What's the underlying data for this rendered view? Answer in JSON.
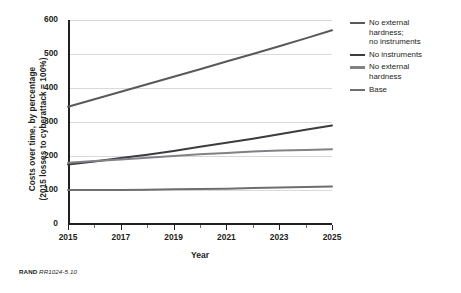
{
  "figure": {
    "caption_prefix": "RAND",
    "caption_code": "RR1024-5.10"
  },
  "axes": {
    "ylabel_line1": "Costs over time, by percentage",
    "ylabel_line2": "(2015 losses to cyberattack = 100%)",
    "xlabel": "Year",
    "ytick_labels": [
      "600",
      "500",
      "400",
      "300",
      "200",
      "100",
      "0"
    ],
    "xtick_labels": [
      "2015",
      "2017",
      "2019",
      "2021",
      "2023",
      "2025"
    ],
    "xtick_minor_values": [
      2016,
      2018,
      2020,
      2022,
      2024
    ]
  },
  "legend": {
    "position": "right",
    "items": [
      {
        "label_line1": "No external",
        "label_line2": "hardness;",
        "label_line3": "no instruments",
        "color": "#58595b"
      },
      {
        "label_line1": "No instruments",
        "label_line2": "",
        "label_line3": "",
        "color": "#3c3c3e"
      },
      {
        "label_line1": "No external",
        "label_line2": "hardness",
        "label_line3": "",
        "color": "#808285"
      },
      {
        "label_line1": "Base",
        "label_line2": "",
        "label_line3": "",
        "color": "#6d6e71"
      }
    ]
  },
  "chart_data": {
    "type": "line",
    "title": "",
    "xlabel": "Year",
    "ylabel": "Costs over time, by percentage (2015 losses to cyberattack = 100%)",
    "x": [
      2015,
      2016,
      2017,
      2018,
      2019,
      2020,
      2021,
      2022,
      2023,
      2024,
      2025
    ],
    "xlim": [
      2015,
      2025
    ],
    "ylim": [
      0,
      600
    ],
    "ytick_step": 100,
    "grid": true,
    "legend_position": "right",
    "series": [
      {
        "name": "No external hardness; no instruments",
        "color": "#58595b",
        "values": [
          345,
          367,
          389,
          411,
          433,
          455,
          478,
          500,
          523,
          546,
          570
        ]
      },
      {
        "name": "No instruments",
        "color": "#3c3c3e",
        "values": [
          175,
          184,
          194,
          204,
          215,
          227,
          239,
          251,
          264,
          277,
          290
        ]
      },
      {
        "name": "No external hardness",
        "color": "#808285",
        "values": [
          180,
          185,
          190,
          195,
          200,
          205,
          209,
          213,
          216,
          218,
          220
        ]
      },
      {
        "name": "Base",
        "color": "#6d6e71",
        "values": [
          100,
          100,
          100,
          101,
          102,
          103,
          104,
          106,
          107,
          109,
          110
        ]
      }
    ]
  }
}
